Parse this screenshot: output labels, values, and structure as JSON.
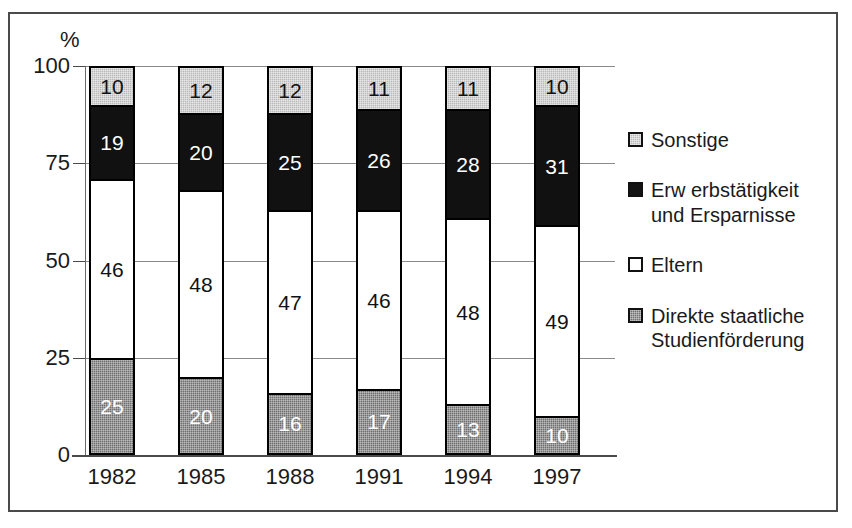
{
  "axis": {
    "unit_label": "%",
    "y_ticks": [
      "100",
      "75",
      "50",
      "25",
      "0"
    ],
    "x_ticks": [
      "1982",
      "1985",
      "1988",
      "1991",
      "1994",
      "1997"
    ]
  },
  "legend": {
    "entries": [
      {
        "label": "Sonstige",
        "swatch": "light-gray-swatch",
        "color": "#b9b9b9"
      },
      {
        "label": "Erw erbstätigkeit\nund Ersparnisse",
        "swatch": "black-swatch",
        "color": "#141414"
      },
      {
        "label": "Eltern",
        "swatch": "white-swatch",
        "color": "#ffffff"
      },
      {
        "label": "Direkte staatliche\nStudienförderung",
        "swatch": "dark-gray-swatch",
        "color": "#6f6f6f"
      }
    ]
  },
  "chart_data": {
    "type": "bar",
    "stacked": true,
    "title": "",
    "xlabel": "",
    "ylabel": "%",
    "ylim": [
      0,
      100
    ],
    "yticks": [
      0,
      25,
      50,
      75,
      100
    ],
    "grid": true,
    "legend_position": "right",
    "categories": [
      "1982",
      "1985",
      "1988",
      "1991",
      "1994",
      "1997"
    ],
    "series": [
      {
        "name": "Direkte staatliche Studienförderung",
        "color": "#6f6f6f",
        "values": [
          25,
          20,
          16,
          17,
          13,
          10
        ]
      },
      {
        "name": "Eltern",
        "color": "#ffffff",
        "values": [
          46,
          48,
          47,
          46,
          48,
          49
        ]
      },
      {
        "name": "Erwerbstätigkeit und Ersparnisse",
        "color": "#141414",
        "values": [
          19,
          20,
          25,
          26,
          28,
          31
        ]
      },
      {
        "name": "Sonstige",
        "color": "#b9b9b9",
        "values": [
          10,
          12,
          12,
          11,
          11,
          10
        ]
      }
    ]
  }
}
